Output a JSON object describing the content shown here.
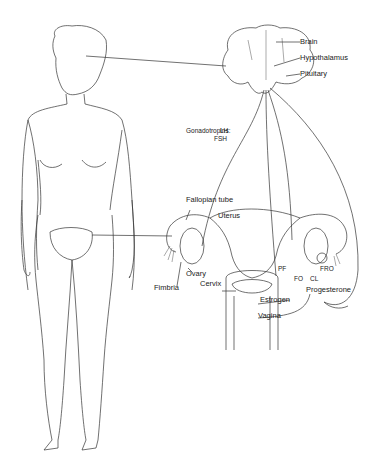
{
  "labels": {
    "brain": "Brain",
    "hypothalamus": "Hypothalamus",
    "pituitary": "Pituitary",
    "gonadotropins": "Gonadotropins:",
    "lh": "LH",
    "fsh": "FSH",
    "fallopian_tube": "Fallopian tube",
    "uterus": "Uterus",
    "ovary": "Ovary",
    "fimbria": "Fimbria",
    "cervix": "Cervix",
    "vagina": "Vagina",
    "estrogen": "Estrogen",
    "progesterone": "Progesterone",
    "pf": "PF",
    "fo": "FO",
    "cl": "CL",
    "fro": "FRO"
  },
  "colors": {
    "line": "#333333",
    "background": "#ffffff"
  }
}
